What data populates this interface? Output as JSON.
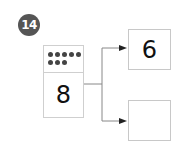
{
  "problem": {
    "number": "14",
    "total": "8",
    "dot_count": 8,
    "dots_rows": [
      5,
      3
    ],
    "parts": [
      {
        "value": "6"
      },
      {
        "value": ""
      }
    ]
  },
  "colors": {
    "badge_bg": "#555555",
    "border": "#cfcfcf",
    "dot": "#444444",
    "line": "#888888",
    "arrow": "#222222"
  }
}
